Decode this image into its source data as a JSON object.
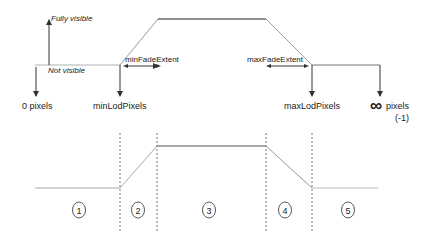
{
  "diagram": {
    "top": {
      "fully_visible": "Fully visible",
      "not_visible": "Not visible",
      "min_fade_extent": "minFadeExtent",
      "max_fade_extent": "maxFadeExtent",
      "markers": [
        {
          "label": "0 pixels"
        },
        {
          "label": "minLodPixels"
        },
        {
          "label": "maxLodPixels"
        },
        {
          "label": "pixels",
          "symbol": "∞",
          "sub": "(-1)"
        }
      ]
    },
    "bottom": {
      "regions": [
        "1",
        "2",
        "3",
        "4",
        "5"
      ]
    },
    "colors": {
      "line_dark": "#555555",
      "line_light": "#b0b0b0",
      "arrow": "#333333",
      "dashed": "#777777"
    }
  }
}
